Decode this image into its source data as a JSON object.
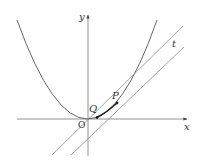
{
  "diagram": {
    "type": "parabola with secant and tangent lines",
    "colors": {
      "curve": "#555555",
      "axes": "#666666",
      "lines": "#888888",
      "points": "#222222",
      "background": "#ffffff"
    },
    "axes": {
      "x_label": "x",
      "y_label": "y",
      "origin_label": "O"
    },
    "curve": {
      "label": "parabola y = x^2",
      "equation_shown": false
    },
    "points": [
      {
        "label": "Q",
        "description": "point on parabola near origin"
      },
      {
        "label": "P",
        "description": "point on parabola"
      }
    ],
    "lines": [
      {
        "label": "",
        "description": "secant line through Q and P"
      },
      {
        "label": "t",
        "description": "tangent line at P"
      }
    ]
  }
}
